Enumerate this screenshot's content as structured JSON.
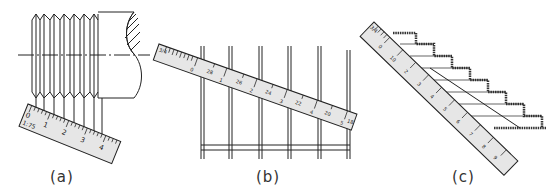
{
  "figure": {
    "panels": [
      {
        "id": "a",
        "caption": "(a)",
        "subject": "screw thread with scale measuring pitch",
        "scale_label": "1:75",
        "scale_numbers": [
          "0",
          "1",
          "2",
          "3",
          "4"
        ]
      },
      {
        "id": "b",
        "caption": "(b)",
        "subject": "scale placed diagonally to divide space into equal parts",
        "scale_numbers_major": [
          "0",
          "1",
          "2",
          "3",
          "4",
          "5"
        ],
        "scale_numbers_minor": [
          "28",
          "26",
          "24",
          "22",
          "20",
          "18"
        ],
        "scale_end_label": "3/4"
      },
      {
        "id": "c",
        "caption": "(c)",
        "subject": "scale used to divide stair risers",
        "scale_end_label": "3/4",
        "scale_numbers": [
          "0",
          "10",
          "2",
          "3",
          "4",
          "5",
          "6",
          "7",
          "8",
          "9",
          "10"
        ]
      }
    ],
    "colors": {
      "line": "#222222",
      "ruler_fill": "#e6e6e6",
      "background": "#ffffff"
    }
  }
}
